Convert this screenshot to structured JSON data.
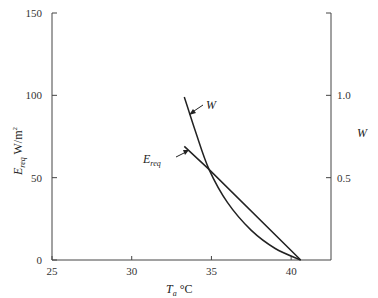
{
  "chart_data": {
    "type": "line",
    "title": "",
    "xlabel": "Ta °C",
    "ylabel": "Ereq W/m²",
    "y2label": "W",
    "xlim": [
      25,
      42.5
    ],
    "ylim": [
      0,
      150
    ],
    "y2lim": [
      0,
      1.5
    ],
    "x_ticks": [
      25,
      30,
      35,
      40
    ],
    "y_ticks": [
      0,
      50,
      100,
      150
    ],
    "y2_ticks": [
      0.5,
      1.0
    ],
    "x_tick_labels": [
      "25",
      "30",
      "35",
      "40"
    ],
    "y_tick_labels": [
      "0",
      "50",
      "100",
      "150"
    ],
    "y2_tick_labels": [
      "0.5",
      "1.0"
    ],
    "grid": false,
    "legend": "inline annotations with arrows",
    "series": [
      {
        "name": "W",
        "axis": "right",
        "label": "W",
        "x": [
          33.3,
          34.0,
          34.85,
          36.0,
          37.5,
          39.0,
          40.6
        ],
        "values": [
          0.99,
          0.78,
          0.55,
          0.35,
          0.18,
          0.07,
          0.0
        ]
      },
      {
        "name": "Ereq",
        "axis": "left",
        "label": "Ereq",
        "x": [
          33.3,
          34.85,
          40.6
        ],
        "values": [
          69,
          55,
          0
        ]
      }
    ],
    "annotations": [
      {
        "text": "W",
        "points_to": "W curve near T=33.5"
      },
      {
        "text": "Ereq",
        "points_to": "Ereq line near T=33.7"
      }
    ]
  },
  "labels": {
    "y_main": "E",
    "y_main_sub": "req",
    "y_main_unit": " W/m",
    "y_main_sup": "2",
    "x_main": "T",
    "x_main_sub": "a",
    "x_main_unit": " °C",
    "y_right": "W",
    "series_w": "W",
    "series_e": "E",
    "series_e_sub": "req"
  }
}
